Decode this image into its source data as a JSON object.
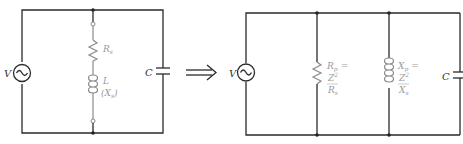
{
  "left_circuit": {
    "source_label": "V",
    "series_resistor": {
      "symbol": "R",
      "subscript": "s"
    },
    "series_inductor": {
      "symbol": "L",
      "reactance": "(X",
      "reactance_sub": "s",
      "reactance_close": ")"
    },
    "capacitor_label": "C"
  },
  "arrow": {
    "symbol": "⟹",
    "meaning": "equivalent-to"
  },
  "right_circuit": {
    "source_label": "V",
    "parallel_resistor": {
      "symbol": "R",
      "subscript": "p",
      "eq": "=",
      "numerator": "Z",
      "num_sup": "2",
      "num_sub": "s",
      "denominator": "R",
      "den_sub": "s"
    },
    "parallel_inductor": {
      "symbol": "X",
      "subscript": "p",
      "eq": "=",
      "numerator": "Z",
      "num_sup": "2",
      "num_sub": "s",
      "denominator": "X",
      "den_sub": "s"
    },
    "capacitor_label": "C"
  },
  "colors": {
    "wire": "#2a2a2a",
    "component": "#8a8a8a"
  }
}
